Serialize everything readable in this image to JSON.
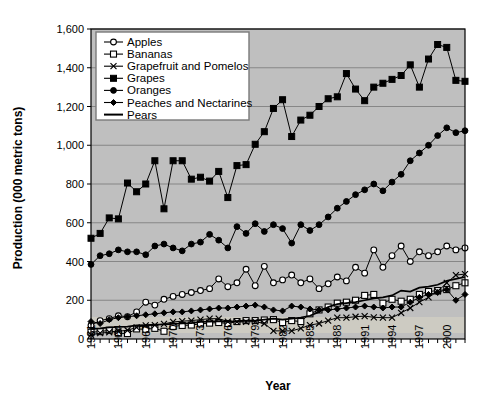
{
  "chart_data": {
    "type": "line",
    "title": "",
    "xlabel": "Year",
    "ylabel": "Production (000 metric tons)",
    "ylim": [
      0,
      1600
    ],
    "ytick_step": 200,
    "yticks": [
      "0",
      "200",
      "400",
      "600",
      "800",
      "1,000",
      "1,200",
      "1,400",
      "1,600"
    ],
    "xlim": [
      1961,
      2002
    ],
    "xtick_labels": [
      "1961",
      "1964",
      "1967",
      "1970",
      "1973",
      "1976",
      "1979",
      "1982",
      "1985",
      "1988",
      "1991",
      "1994",
      "1997",
      "2000"
    ],
    "xtick_label_step": 3,
    "grid": "horizontal",
    "legend_position": "top-left-inside",
    "plot_background": "#bfbfbf",
    "x": [
      1961,
      1962,
      1963,
      1964,
      1965,
      1966,
      1967,
      1968,
      1969,
      1970,
      1971,
      1972,
      1973,
      1974,
      1975,
      1976,
      1977,
      1978,
      1979,
      1980,
      1981,
      1982,
      1983,
      1984,
      1985,
      1986,
      1987,
      1988,
      1989,
      1990,
      1991,
      1992,
      1993,
      1994,
      1995,
      1996,
      1997,
      1998,
      1999,
      2000,
      2001,
      2002
    ],
    "series": [
      {
        "name": "Apples",
        "marker": "open-circle",
        "values": [
          70,
          95,
          105,
          120,
          115,
          140,
          190,
          175,
          205,
          220,
          230,
          240,
          250,
          260,
          310,
          270,
          290,
          360,
          275,
          375,
          290,
          305,
          330,
          290,
          310,
          260,
          285,
          320,
          300,
          370,
          340,
          460,
          370,
          430,
          480,
          400,
          450,
          430,
          450,
          480,
          460,
          470
        ]
      },
      {
        "name": "Bananas",
        "marker": "open-square",
        "values": [
          35,
          38,
          45,
          30,
          28,
          52,
          50,
          55,
          40,
          65,
          70,
          72,
          78,
          82,
          85,
          80,
          90,
          95,
          95,
          98,
          100,
          85,
          95,
          90,
          130,
          150,
          165,
          185,
          190,
          200,
          225,
          230,
          185,
          205,
          195,
          205,
          230,
          245,
          250,
          255,
          275,
          290
        ]
      },
      {
        "name": "Grapefruit and Pomelos",
        "marker": "x",
        "values": [
          22,
          30,
          35,
          40,
          45,
          60,
          70,
          72,
          78,
          88,
          92,
          95,
          100,
          105,
          105,
          90,
          88,
          88,
          90,
          80,
          42,
          42,
          42,
          55,
          72,
          80,
          95,
          110,
          110,
          115,
          118,
          112,
          110,
          110,
          135,
          160,
          190,
          215,
          245,
          290,
          330,
          335
        ]
      },
      {
        "name": "Grapes",
        "marker": "filled-square",
        "values": [
          520,
          545,
          625,
          620,
          805,
          760,
          800,
          920,
          672,
          920,
          920,
          825,
          835,
          815,
          865,
          730,
          895,
          900,
          1005,
          1070,
          1190,
          1235,
          1045,
          1130,
          1155,
          1200,
          1240,
          1250,
          1370,
          1290,
          1230,
          1300,
          1320,
          1340,
          1360,
          1415,
          1300,
          1445,
          1520,
          1505,
          1335,
          1330
        ]
      },
      {
        "name": "Oranges",
        "marker": "filled-circle",
        "values": [
          385,
          430,
          440,
          460,
          450,
          450,
          435,
          480,
          490,
          470,
          455,
          490,
          500,
          540,
          510,
          470,
          580,
          545,
          595,
          555,
          590,
          570,
          495,
          590,
          560,
          590,
          630,
          675,
          710,
          745,
          770,
          800,
          765,
          810,
          850,
          920,
          960,
          1000,
          1050,
          1090,
          1065,
          1075
        ]
      },
      {
        "name": "Peaches and Nectarines",
        "marker": "filled-diamond",
        "values": [
          90,
          80,
          100,
          110,
          115,
          120,
          125,
          130,
          135,
          140,
          140,
          145,
          150,
          155,
          160,
          160,
          165,
          170,
          175,
          165,
          150,
          145,
          170,
          165,
          155,
          150,
          150,
          155,
          160,
          165,
          170,
          165,
          160,
          165,
          165,
          190,
          215,
          230,
          240,
          255,
          200,
          230
        ]
      },
      {
        "name": "Pears",
        "marker": "none",
        "values": [
          52,
          55,
          60,
          62,
          64,
          70,
          72,
          74,
          75,
          78,
          80,
          82,
          88,
          90,
          92,
          88,
          92,
          95,
          95,
          100,
          105,
          100,
          105,
          110,
          120,
          140,
          165,
          180,
          185,
          190,
          200,
          210,
          215,
          225,
          250,
          245,
          265,
          270,
          280,
          300,
          310,
          320
        ]
      }
    ]
  },
  "legend": {
    "items": [
      {
        "label": "Apples"
      },
      {
        "label": "Bananas"
      },
      {
        "label": "Grapefruit and Pomelos"
      },
      {
        "label": "Grapes"
      },
      {
        "label": "Oranges"
      },
      {
        "label": "Peaches and Nectarines"
      },
      {
        "label": "Pears"
      }
    ]
  }
}
